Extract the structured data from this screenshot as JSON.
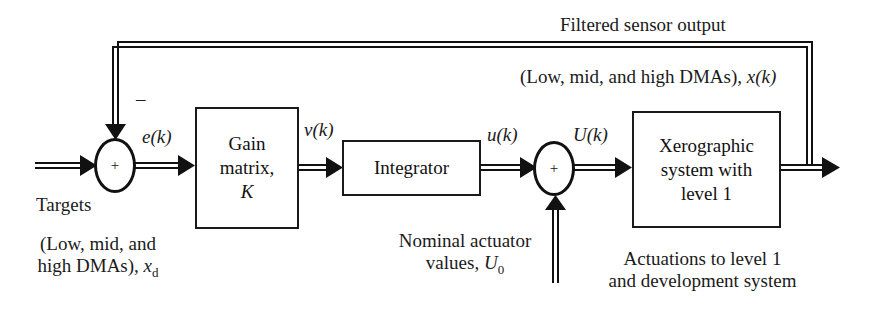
{
  "diagram": {
    "type": "feedback-control-block-diagram",
    "feedback_label": "Filtered sensor output",
    "feedback_signal_label": "(Low, mid, and high DMAs), ",
    "feedback_signal_var": "x(k)",
    "feedback_sign": "–",
    "input": {
      "label": "Targets",
      "desc_line1": "(Low, mid, and",
      "desc_line2": "high DMAs), ",
      "var": "x",
      "var_sub": "d"
    },
    "summer1": {
      "sign": "+"
    },
    "signals": {
      "error": "e(k)",
      "v": "ν(k)",
      "u": "u(k)",
      "U": "U(k)"
    },
    "blocks": {
      "gain": {
        "line1": "Gain",
        "line2": "matrix,",
        "line3": "K"
      },
      "integrator": {
        "label": "Integrator"
      },
      "plant": {
        "line1": "Xerographic",
        "line2": "system with",
        "line3": "level 1"
      }
    },
    "summer2": {
      "sign": "+"
    },
    "nominal": {
      "line1": "Nominal actuator",
      "line2": "values, ",
      "var": "U",
      "var_sub": "0"
    },
    "actuations": {
      "line1": "Actuations to level 1",
      "line2": "and development system"
    }
  }
}
